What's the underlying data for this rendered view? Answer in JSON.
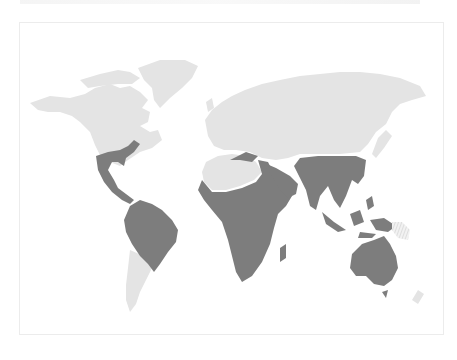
{
  "map": {
    "type": "world distribution map",
    "colors": {
      "background": "#ffffff",
      "land": "#e4e4e4",
      "highlight_zone": "#7d7d7d",
      "frame_border": "#ececec"
    },
    "land_regions": [
      {
        "name": "north-america",
        "d": "M30 103 L50 96 L70 98 L85 94 L95 88 L110 84 L120 88 L130 86 L140 92 L148 100 L142 108 L150 112 L148 122 L140 126 L150 132 L158 130 L162 140 L152 148 L140 152 L128 160 L120 166 L110 162 L100 155 L95 145 L90 132 L80 122 L72 116 L60 112 L48 112 L38 110 Z"
      },
      {
        "name": "canadian-arctic",
        "d": "M80 80 L100 74 L118 70 L130 72 L140 78 L132 84 L118 84 L100 86 L88 88 Z"
      },
      {
        "name": "greenland",
        "d": "M138 68 L160 60 L185 60 L198 66 L192 78 L182 88 L170 98 L160 108 L154 100 L152 88 L144 80 Z"
      },
      {
        "name": "south-america-south",
        "d": "M130 250 L148 258 L152 268 L146 280 L140 292 L136 304 L130 312 L126 300 L126 285 L128 268 Z"
      },
      {
        "name": "eurasia",
        "d": "M205 120 L212 110 L222 102 L232 96 L245 90 L262 84 L280 80 L300 76 L320 74 L340 72 L360 72 L380 74 L400 78 L420 86 L426 96 L412 100 L400 104 L392 112 L386 124 L376 132 L368 144 L360 152 L340 154 L320 154 L300 154 L288 158 L276 160 L262 158 L250 152 L236 150 L224 150 L214 146 L208 136 Z"
      },
      {
        "name": "uk",
        "d": "M206 102 L212 98 L214 108 L208 112 Z"
      },
      {
        "name": "japan",
        "d": "M378 138 L386 130 L392 136 L384 148 L376 158 L372 154 Z"
      },
      {
        "name": "sahara",
        "d": "M206 162 L218 156 L232 154 L246 156 L256 162 L262 172 L254 180 L240 186 L226 190 L212 190 L204 182 L202 172 Z"
      },
      {
        "name": "new-zealand",
        "d": "M418 290 L424 294 L418 304 L412 300 Z"
      }
    ],
    "highlight_regions": [
      {
        "name": "southeast-us-mexico-central-america",
        "d": "M96 156 L108 152 L120 150 L128 146 L134 140 L140 144 L134 152 L126 158 L124 166 L118 162 L112 162 L108 170 L114 180 L118 188 L126 194 L134 200 L130 204 L122 200 L112 192 L104 182 L98 170 Z"
      },
      {
        "name": "south-america-tropical",
        "d": "M130 206 L140 200 L152 204 L162 210 L172 220 L178 230 L176 242 L168 252 L160 264 L154 272 L148 264 L140 256 L132 244 L126 232 L124 220 Z"
      },
      {
        "name": "africa-tropical",
        "d": "M202 180 L212 192 L226 192 L242 188 L256 182 L262 174 L258 160 L268 162 L276 178 L284 190 L292 196 L286 206 L278 214 L274 228 L270 244 L262 262 L252 276 L242 282 L236 272 L232 256 L228 240 L222 222 L212 210 L204 200 L198 190 Z"
      },
      {
        "name": "madagascar",
        "d": "M280 248 L286 244 L286 258 L280 262 Z"
      },
      {
        "name": "north-africa-coast",
        "d": "M230 160 L246 152 L258 156 L252 162 L240 160 Z"
      },
      {
        "name": "arabia",
        "d": "M262 162 L276 168 L290 176 L298 184 L296 194 L288 198 L280 190 L272 176 Z"
      },
      {
        "name": "south-asia-indochina",
        "d": "M300 158 L318 156 L338 156 L356 156 L366 160 L364 176 L358 184 L352 180 L346 196 L340 208 L334 200 L328 186 L320 196 L316 210 L310 206 L306 190 L300 178 L294 166 Z"
      },
      {
        "name": "indonesia-philippines",
        "d": "M322 212 L334 222 L346 230 L338 232 L326 224 Z M350 214 L360 210 L364 222 L354 226 Z M366 200 L372 196 L374 206 L368 210 Z M360 232 L376 234 L372 238 L358 238 Z"
      },
      {
        "name": "new-guinea",
        "d": "M370 220 L384 218 L396 226 L388 232 L376 230 Z"
      },
      {
        "name": "australia",
        "d": "M352 254 L362 244 L374 240 L384 236 L390 244 L396 256 L398 268 L392 280 L384 286 L374 284 L366 276 L356 276 L350 268 Z"
      },
      {
        "name": "tasmania",
        "d": "M382 292 L388 290 L386 298 Z"
      }
    ],
    "hatched_regions": [
      {
        "name": "pacific-islands-hatched",
        "d": "M392 222 L402 222 L410 230 L408 240 L398 238 L392 230 Z"
      }
    ]
  }
}
